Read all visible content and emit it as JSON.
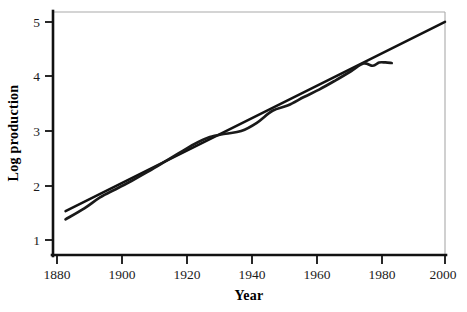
{
  "chart_data": {
    "type": "line",
    "title": "",
    "xlabel": "Year",
    "ylabel": "Log production",
    "xlim": [
      1875,
      2000
    ],
    "ylim": [
      0.82,
      5.25
    ],
    "xticks": [
      1880,
      1900,
      1920,
      1940,
      1960,
      1980,
      2000
    ],
    "xticklabels": [
      "1880",
      "1900",
      "1920",
      "1940",
      "1960",
      "1980",
      "2000"
    ],
    "yticks": [
      1,
      2,
      3,
      4,
      5
    ],
    "yticklabels": [
      "1",
      "2",
      "3",
      "4",
      "5"
    ],
    "grid": false,
    "legend": "none",
    "frame": {
      "left_spine": "thick-black",
      "bottom_spine": "thick-black",
      "top_spine": "thin-gray",
      "right_spine": "thin-gray"
    },
    "colors": {
      "trend_line": "#121212",
      "data_line": "#1a1a1a",
      "axis": "#111111",
      "frame_light": "#a9a9a9",
      "background": "#ffffff"
    },
    "series": [
      {
        "name": "trend",
        "description": "straight fitted exponential-growth trend line spanning full axis",
        "x": [
          1879,
          2000
        ],
        "values": [
          1.62,
          5.07
        ]
      },
      {
        "name": "log-production",
        "description": "observed log production, rises steadily then flattens after 1975",
        "x": [
          1879,
          1885,
          1890,
          1895,
          1900,
          1905,
          1910,
          1915,
          1920,
          1925,
          1930,
          1935,
          1940,
          1945,
          1950,
          1955,
          1960,
          1965,
          1970,
          1974,
          1977,
          1979,
          1981,
          1983
        ],
        "values": [
          1.47,
          1.67,
          1.87,
          2.02,
          2.17,
          2.33,
          2.5,
          2.67,
          2.84,
          2.97,
          3.03,
          3.08,
          3.23,
          3.45,
          3.55,
          3.7,
          3.84,
          4.0,
          4.17,
          4.31,
          4.27,
          4.33,
          4.33,
          4.32
        ]
      }
    ]
  },
  "figure": {
    "xlabel": "Year",
    "ylabel": "Log production"
  }
}
